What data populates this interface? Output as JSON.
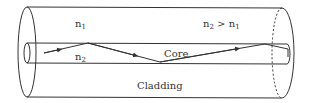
{
  "diagram": {
    "labels": {
      "cladding_index": {
        "base": "n",
        "sub": "1"
      },
      "core_index": {
        "base": "n",
        "sub": "2"
      },
      "condition": {
        "base1": "n",
        "sub1": "2",
        "op": " > ",
        "base2": "n",
        "sub2": "1"
      },
      "core": "Core",
      "cladding": "Cladding"
    },
    "colors": {
      "stroke": "#333333",
      "background": "#ffffff"
    },
    "ray_path": [
      [
        44,
        53
      ],
      [
        88,
        43
      ],
      [
        160,
        62
      ],
      [
        265,
        44
      ],
      [
        288,
        49
      ]
    ]
  }
}
